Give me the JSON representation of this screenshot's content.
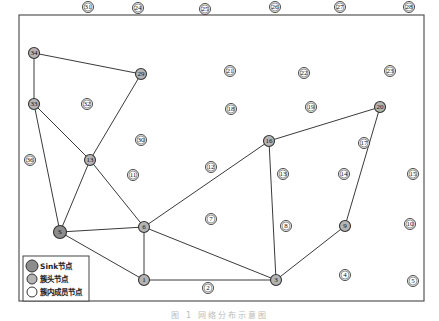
{
  "diagram": {
    "caption": "图 1  网络分布示意图",
    "frame": {
      "x": 19,
      "y": 15,
      "width": 405,
      "height": 286
    },
    "colors": {
      "sink_fill": "#8c8c8c",
      "head_fill": "#b4b4b4",
      "member_fill": "#ffffff",
      "stroke": "#333333",
      "edge": "#3a3a3a"
    },
    "legend": {
      "items": [
        {
          "type": "sink",
          "label": "Sink节点"
        },
        {
          "type": "head",
          "label": "簇头节点"
        },
        {
          "type": "member",
          "label": "簇内成员节点"
        }
      ]
    },
    "nodes": [
      {
        "id": "S",
        "label": "S",
        "type": "sink",
        "x": 60,
        "y": 232
      },
      {
        "id": "1",
        "label": "1",
        "type": "head",
        "x": 144,
        "y": 280
      },
      {
        "id": "2",
        "label": "2",
        "type": "member",
        "x": 208,
        "y": 288
      },
      {
        "id": "3",
        "label": "3",
        "type": "head",
        "x": 276,
        "y": 280
      },
      {
        "id": "4",
        "label": "4",
        "type": "member",
        "x": 345,
        "y": 275
      },
      {
        "id": "5",
        "label": "5",
        "type": "member",
        "x": 413,
        "y": 281
      },
      {
        "id": "6",
        "label": "6",
        "type": "head",
        "x": 144,
        "y": 227
      },
      {
        "id": "7",
        "label": "7",
        "type": "member",
        "x": 211,
        "y": 219
      },
      {
        "id": "8",
        "label": "8",
        "type": "member",
        "x": 286,
        "y": 226
      },
      {
        "id": "9",
        "label": "9",
        "type": "head",
        "x": 345,
        "y": 226
      },
      {
        "id": "10",
        "label": "10",
        "type": "member",
        "x": 410,
        "y": 224
      },
      {
        "id": "11",
        "label": "11",
        "type": "member",
        "x": 133,
        "y": 175
      },
      {
        "id": "12",
        "label": "12",
        "type": "member",
        "x": 211,
        "y": 167
      },
      {
        "id": "13a",
        "label": "13",
        "type": "head",
        "x": 90,
        "y": 160
      },
      {
        "id": "13b",
        "label": "13",
        "type": "member",
        "x": 283,
        "y": 174
      },
      {
        "id": "14",
        "label": "14",
        "type": "member",
        "x": 344,
        "y": 174
      },
      {
        "id": "15",
        "label": "15",
        "type": "member",
        "x": 413,
        "y": 174
      },
      {
        "id": "16",
        "label": "16",
        "type": "head",
        "x": 269,
        "y": 141
      },
      {
        "id": "17",
        "label": "17",
        "type": "member",
        "x": 364,
        "y": 143
      },
      {
        "id": "18",
        "label": "18",
        "type": "member",
        "x": 231,
        "y": 109
      },
      {
        "id": "19",
        "label": "19",
        "type": "member",
        "x": 311,
        "y": 107
      },
      {
        "id": "20",
        "label": "20",
        "type": "head",
        "x": 380,
        "y": 107
      },
      {
        "id": "21",
        "label": "21",
        "type": "member",
        "x": 230,
        "y": 71
      },
      {
        "id": "22",
        "label": "22",
        "type": "member",
        "x": 304,
        "y": 73
      },
      {
        "id": "23",
        "label": "23",
        "type": "member",
        "x": 390,
        "y": 71
      },
      {
        "id": "24",
        "label": "24",
        "type": "member",
        "x": 138,
        "y": 8
      },
      {
        "id": "25",
        "label": "25",
        "type": "member",
        "x": 205,
        "y": 9
      },
      {
        "id": "26",
        "label": "26",
        "type": "member",
        "x": 275,
        "y": 7
      },
      {
        "id": "27",
        "label": "27",
        "type": "member",
        "x": 340,
        "y": 7
      },
      {
        "id": "28",
        "label": "28",
        "type": "member",
        "x": 409,
        "y": 7
      },
      {
        "id": "29",
        "label": "29",
        "type": "head",
        "x": 141,
        "y": 74
      },
      {
        "id": "30",
        "label": "30",
        "type": "member",
        "x": 141,
        "y": 140
      },
      {
        "id": "31",
        "label": "31",
        "type": "member",
        "x": 88,
        "y": 7
      },
      {
        "id": "32",
        "label": "32",
        "type": "member",
        "x": 87,
        "y": 104
      },
      {
        "id": "33",
        "label": "33",
        "type": "head",
        "x": 34,
        "y": 104
      },
      {
        "id": "34",
        "label": "34",
        "type": "head",
        "x": 34,
        "y": 53
      },
      {
        "id": "36",
        "label": "36",
        "type": "member",
        "x": 30,
        "y": 160
      }
    ],
    "edges": [
      [
        "34",
        "29"
      ],
      [
        "34",
        "33"
      ],
      [
        "29",
        "13a"
      ],
      [
        "33",
        "13a"
      ],
      [
        "33",
        "S"
      ],
      [
        "13a",
        "S"
      ],
      [
        "13a",
        "6"
      ],
      [
        "S",
        "6"
      ],
      [
        "S",
        "1"
      ],
      [
        "6",
        "1"
      ],
      [
        "6",
        "16"
      ],
      [
        "6",
        "3"
      ],
      [
        "1",
        "3"
      ],
      [
        "16",
        "20"
      ],
      [
        "16",
        "3"
      ],
      [
        "20",
        "9"
      ],
      [
        "9",
        "3"
      ]
    ]
  }
}
